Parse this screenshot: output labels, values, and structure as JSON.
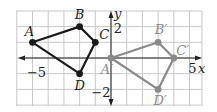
{
  "diagram": {
    "type": "coordinate-plane-translation",
    "grid": {
      "x_min": -6,
      "x_max": 6,
      "y_min": -3,
      "y_max": 3,
      "origin_px": [
        111,
        58
      ],
      "cell_px": 15.7,
      "left_px": 16,
      "right_px": 202,
      "top_px": 11,
      "bottom_px": 106,
      "grid_color": "#c8c8c8"
    },
    "axes": {
      "x_label": "x",
      "y_label": "y",
      "x_tick_labels": [
        {
          "value": -5,
          "text": "−5"
        },
        {
          "value": 5,
          "text": "5"
        }
      ],
      "y_tick_labels": [
        {
          "value": 2,
          "text": "2"
        },
        {
          "value": -2,
          "text": "−2"
        }
      ],
      "color": "#222222"
    },
    "original": {
      "color": "#1a1a1a",
      "vertices": [
        {
          "name": "A",
          "x": -5,
          "y": 1
        },
        {
          "name": "B",
          "x": -2,
          "y": 2
        },
        {
          "name": "C",
          "x": -1,
          "y": 1
        },
        {
          "name": "D",
          "x": -2,
          "y": -1
        }
      ]
    },
    "image": {
      "color": "#8a8a8a",
      "vertices": [
        {
          "name": "A′",
          "x": 0,
          "y": 0
        },
        {
          "name": "B′",
          "x": 3,
          "y": 1
        },
        {
          "name": "C′",
          "x": 4,
          "y": 0
        },
        {
          "name": "D′",
          "x": 3,
          "y": -2
        }
      ]
    }
  }
}
